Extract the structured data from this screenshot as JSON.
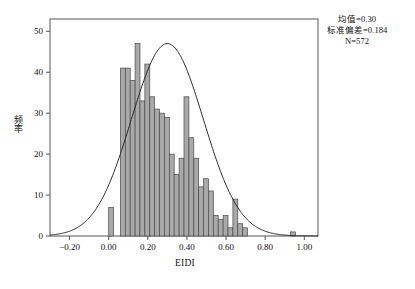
{
  "chart_data": {
    "type": "bar",
    "title": "",
    "subtitle": "",
    "xlabel": "EIDI",
    "ylabel": "频率",
    "xlim": [
      -0.3,
      1.07
    ],
    "ylim": [
      0,
      53
    ],
    "grid": false,
    "bin_width": 0.025,
    "x_ticks": [
      -0.2,
      0.0,
      0.2,
      0.4,
      0.6,
      0.8,
      1.0
    ],
    "x_tick_labels": [
      "−0.20",
      "0.00",
      "0.20",
      "0.40",
      "0.60",
      "0.80",
      "1.00"
    ],
    "y_ticks": [
      0,
      10,
      20,
      30,
      40,
      50
    ],
    "y_tick_labels": [
      "0",
      "10",
      "20",
      "30",
      "40",
      "50"
    ],
    "bar_fill": "#a9a9a9",
    "bar_stroke": "#4a4a4a",
    "curve_color": "#2b2b2b",
    "axis_color": "#555555",
    "bins": [
      {
        "x0": 0.0,
        "x1": 0.025,
        "value": 7
      },
      {
        "x0": 0.06,
        "x1": 0.085,
        "value": 41
      },
      {
        "x0": 0.085,
        "x1": 0.11,
        "value": 41
      },
      {
        "x0": 0.11,
        "x1": 0.135,
        "value": 38
      },
      {
        "x0": 0.135,
        "x1": 0.16,
        "value": 47
      },
      {
        "x0": 0.16,
        "x1": 0.185,
        "value": 33
      },
      {
        "x0": 0.185,
        "x1": 0.21,
        "value": 42
      },
      {
        "x0": 0.21,
        "x1": 0.235,
        "value": 34
      },
      {
        "x0": 0.235,
        "x1": 0.26,
        "value": 31
      },
      {
        "x0": 0.26,
        "x1": 0.285,
        "value": 30
      },
      {
        "x0": 0.285,
        "x1": 0.31,
        "value": 29
      },
      {
        "x0": 0.31,
        "x1": 0.335,
        "value": 20
      },
      {
        "x0": 0.335,
        "x1": 0.36,
        "value": 15
      },
      {
        "x0": 0.36,
        "x1": 0.385,
        "value": 19
      },
      {
        "x0": 0.385,
        "x1": 0.41,
        "value": 34
      },
      {
        "x0": 0.41,
        "x1": 0.435,
        "value": 24
      },
      {
        "x0": 0.435,
        "x1": 0.46,
        "value": 19
      },
      {
        "x0": 0.46,
        "x1": 0.485,
        "value": 12
      },
      {
        "x0": 0.485,
        "x1": 0.51,
        "value": 14
      },
      {
        "x0": 0.51,
        "x1": 0.535,
        "value": 11
      },
      {
        "x0": 0.535,
        "x1": 0.56,
        "value": 5
      },
      {
        "x0": 0.56,
        "x1": 0.585,
        "value": 4
      },
      {
        "x0": 0.585,
        "x1": 0.61,
        "value": 5
      },
      {
        "x0": 0.61,
        "x1": 0.635,
        "value": 2
      },
      {
        "x0": 0.635,
        "x1": 0.66,
        "value": 9
      },
      {
        "x0": 0.66,
        "x1": 0.685,
        "value": 3
      },
      {
        "x0": 0.685,
        "x1": 0.71,
        "value": 2
      },
      {
        "x0": 0.93,
        "x1": 0.955,
        "value": 1
      }
    ],
    "normal_curve": {
      "mean": 0.3,
      "std": 0.184,
      "n": 572,
      "peak_value": 47,
      "peak_x": 0.25
    },
    "annotations": {
      "mean_label": "均值=0.30",
      "std_label": "标准偏差=0.184",
      "n_label": "N=572"
    }
  }
}
